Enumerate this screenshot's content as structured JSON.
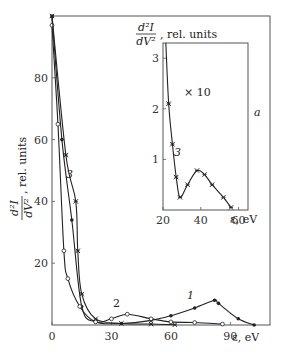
{
  "chart_data": [
    {
      "type": "line",
      "title": "",
      "xlabel": "ε, eV",
      "ylabel": "d²I/dV², rel. units",
      "xlim": [
        0,
        110
      ],
      "ylim": [
        0,
        100
      ],
      "x_ticks": [
        "0",
        "30",
        "60",
        "90"
      ],
      "y_ticks": [
        "20",
        "40",
        "60",
        "80"
      ],
      "grid": false,
      "series": [
        {
          "name": "1",
          "marker": "filled-circle",
          "x": [
            0,
            5,
            10,
            15,
            22,
            35,
            50,
            60,
            72,
            82,
            84,
            94,
            102
          ],
          "y": [
            100,
            60,
            34,
            6,
            1,
            0.5,
            1.5,
            3,
            5.5,
            8,
            7,
            2,
            0
          ]
        },
        {
          "name": "2",
          "marker": "open-circle",
          "x": [
            0,
            3,
            6,
            8,
            14,
            22,
            30,
            38,
            50,
            60,
            72,
            86
          ],
          "y": [
            97,
            65,
            24,
            15,
            6,
            1,
            2,
            3.5,
            2,
            1,
            0.8,
            0.3
          ]
        },
        {
          "name": "3",
          "marker": "cross",
          "x": [
            0,
            7,
            12,
            13,
            15,
            22,
            35,
            50,
            62
          ],
          "y": [
            100,
            55,
            40,
            24,
            10,
            2,
            0.5,
            0.3,
            0.1
          ]
        }
      ]
    },
    {
      "type": "line",
      "title": "inset a",
      "annotation": "× 10",
      "panel_label": "a",
      "xlabel": "ε, eV",
      "ylabel": "d²I/dV², rel. units",
      "xlim": [
        20,
        65
      ],
      "ylim": [
        0,
        3.3
      ],
      "x_ticks": [
        "20",
        "40",
        "60"
      ],
      "y_ticks": [
        "1",
        "2",
        "3"
      ],
      "series": [
        {
          "name": "3",
          "marker": "cross",
          "x": [
            21.5,
            23,
            25,
            27,
            29,
            33,
            38,
            42,
            46,
            52,
            56
          ],
          "y": [
            3.3,
            2.1,
            1.3,
            0.65,
            0.25,
            0.5,
            0.78,
            0.7,
            0.5,
            0.25,
            0.05
          ]
        }
      ]
    }
  ],
  "labels": {
    "y_main_num": "d²I",
    "y_main_den": "dV²",
    "y_main_suffix": ", rel.  units",
    "x_main": "ε, eV",
    "inset_y_num": "d²I",
    "inset_y_den": "dV²",
    "inset_y_suffix": ", rel.  units",
    "inset_x": "ε, eV",
    "inset_annotation": "× 10",
    "panel_label": "a",
    "curve1": "1",
    "curve2": "2",
    "curve3": "3",
    "inset_curve3": "3"
  }
}
